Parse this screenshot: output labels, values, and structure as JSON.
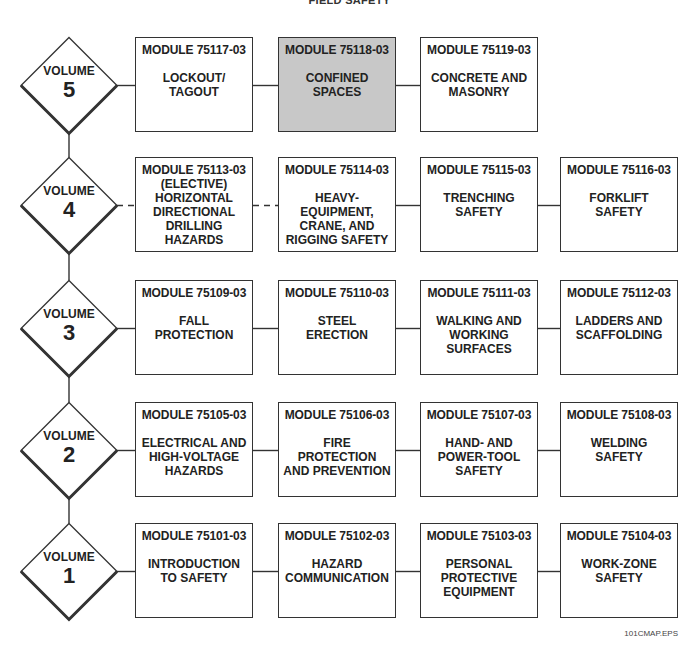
{
  "title": "FIELD SAFETY",
  "footer_label": "101CMAP.EPS",
  "colors": {
    "highlight_fill": "#c8c8c8",
    "line": "#333333",
    "box_fill": "#ffffff"
  },
  "volumes": [
    {
      "word": "VOLUME",
      "number": "5",
      "links": [
        "solid",
        "solid",
        "solid"
      ],
      "modules": [
        {
          "code": "MODULE 75117-03",
          "name": "LOCKOUT/\nTAGOUT"
        },
        {
          "code": "MODULE 75118-03",
          "name": "CONFINED\nSPACES",
          "highlight": true
        },
        {
          "code": "MODULE 75119-03",
          "name": "CONCRETE AND\nMASONRY"
        }
      ]
    },
    {
      "word": "VOLUME",
      "number": "4",
      "links": [
        "dashed",
        "dashed",
        "solid",
        "solid"
      ],
      "modules": [
        {
          "code": "MODULE 75113-03",
          "name": "(ELECTIVE)\nHORIZONTAL\nDIRECTIONAL\nDRILLING\nHAZARDS",
          "elective": true
        },
        {
          "code": "MODULE 75114-03",
          "name": "HEAVY-\nEQUIPMENT,\nCRANE, AND\nRIGGING SAFETY"
        },
        {
          "code": "MODULE 75115-03",
          "name": "TRENCHING\nSAFETY"
        },
        {
          "code": "MODULE 75116-03",
          "name": "FORKLIFT\nSAFETY"
        }
      ]
    },
    {
      "word": "VOLUME",
      "number": "3",
      "links": [
        "solid",
        "solid",
        "solid",
        "solid"
      ],
      "modules": [
        {
          "code": "MODULE 75109-03",
          "name": "FALL\nPROTECTION"
        },
        {
          "code": "MODULE 75110-03",
          "name": "STEEL\nERECTION"
        },
        {
          "code": "MODULE 75111-03",
          "name": "WALKING AND\nWORKING\nSURFACES"
        },
        {
          "code": "MODULE 75112-03",
          "name": "LADDERS AND\nSCAFFOLDING"
        }
      ]
    },
    {
      "word": "VOLUME",
      "number": "2",
      "links": [
        "solid",
        "solid",
        "solid",
        "solid"
      ],
      "modules": [
        {
          "code": "MODULE 75105-03",
          "name": "ELECTRICAL AND\nHIGH-VOLTAGE\nHAZARDS"
        },
        {
          "code": "MODULE 75106-03",
          "name": "FIRE\nPROTECTION\nAND PREVENTION"
        },
        {
          "code": "MODULE 75107-03",
          "name": "HAND- AND\nPOWER-TOOL\nSAFETY"
        },
        {
          "code": "MODULE 75108-03",
          "name": "WELDING\nSAFETY"
        }
      ]
    },
    {
      "word": "VOLUME",
      "number": "1",
      "links": [
        "solid",
        "solid",
        "solid",
        "solid"
      ],
      "modules": [
        {
          "code": "MODULE 75101-03",
          "name": "INTRODUCTION\nTO SAFETY"
        },
        {
          "code": "MODULE 75102-03",
          "name": "HAZARD\nCOMMUNICATION"
        },
        {
          "code": "MODULE 75103-03",
          "name": "PERSONAL\nPROTECTIVE\nEQUIPMENT"
        },
        {
          "code": "MODULE 75104-03",
          "name": "WORK-ZONE\nSAFETY"
        }
      ]
    }
  ]
}
